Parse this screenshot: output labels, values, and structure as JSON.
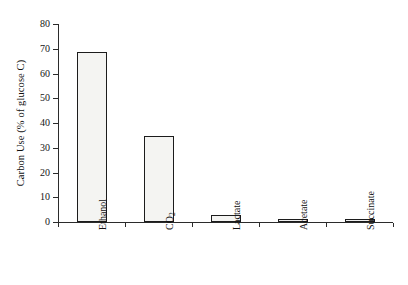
{
  "chart_data": {
    "type": "bar",
    "title": "",
    "subtitle": "",
    "xlabel": "",
    "ylabel": "Carbon Use (% of glucose C)",
    "categories": [
      "Ethanol",
      "CO2",
      "Lactate",
      "Acetate",
      "Succinate"
    ],
    "category_labels_html": [
      "Ethanol",
      "CO₂",
      "Lactate",
      "Acetate",
      "Succinate"
    ],
    "values": [
      68.7,
      34.8,
      3.0,
      0.7,
      1.0
    ],
    "ylim": [
      0,
      80
    ],
    "xlim_note": "categorical",
    "yticks": [
      0,
      10,
      20,
      30,
      40,
      50,
      60,
      70,
      80
    ],
    "ytick_labels": [
      "0",
      "10",
      "20",
      "30",
      "40",
      "50",
      "60",
      "70",
      "80"
    ],
    "grid": false,
    "legend": null,
    "legend_position": "none",
    "orientation": "vertical",
    "bar_fill": "#f4f4f2",
    "bar_edge": "#1c1c1c",
    "axis_color": "#2b2b2b",
    "background": "#ffffff",
    "annotations": []
  },
  "figure": {
    "caption": "",
    "axis_title_y": "Carbon Use (% of glucose C)"
  }
}
